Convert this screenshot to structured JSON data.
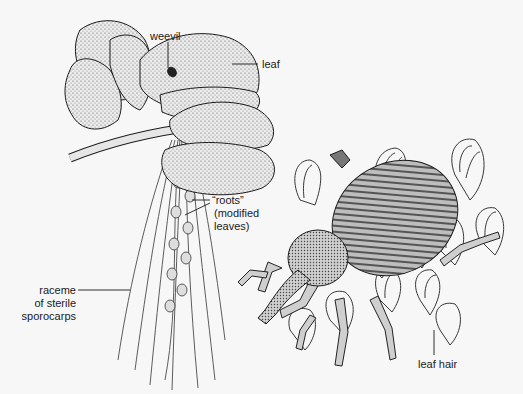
{
  "figure": {
    "labels": {
      "weevil": "weevil",
      "leaf": "leaf",
      "roots_line1": "“roots”",
      "roots_line2": "(modified",
      "roots_line3": "leaves)",
      "raceme_line1": "raceme",
      "raceme_line2": "of sterile",
      "raceme_line3": "sporocarps",
      "leaf_hair": "leaf hair"
    },
    "colors": {
      "background": "#f7f7f7",
      "ink": "#1a1a1a",
      "stipple": "#d8d8d8",
      "shade": "#9a9a9a"
    }
  }
}
